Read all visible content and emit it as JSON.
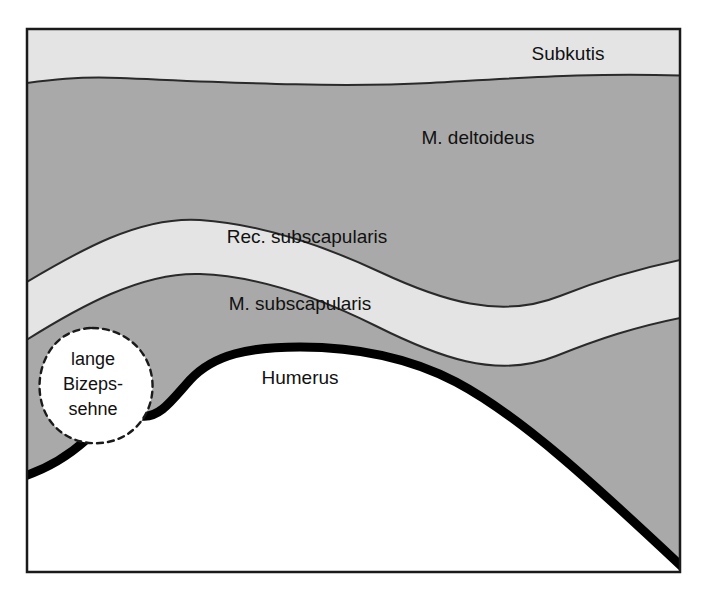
{
  "figure": {
    "frame": {
      "border_color": "#1a1a1a",
      "background_color": "#ffffff"
    },
    "colors": {
      "muscle_gray": "#a9a9a9",
      "fascia_light": "#e4e4e4",
      "bone_white": "#ffffff",
      "outline_dark": "#2a2a2a",
      "bone_outline": "#000000",
      "text": "#111111"
    }
  },
  "layers": [
    {
      "id": "subkutis",
      "label": "Subkutis",
      "label_x": 568,
      "label_y": 55,
      "fill": "#e4e4e4",
      "type": "subcutaneous-tissue"
    },
    {
      "id": "m-deltoideus",
      "label": "M. deltoideus",
      "label_x": 478,
      "label_y": 139,
      "fill": "#a9a9a9",
      "type": "muscle"
    },
    {
      "id": "rec-subscapularis",
      "label": "Rec. subscapularis",
      "label_x": 307,
      "label_y": 238,
      "fill": "#e4e4e4",
      "type": "recess"
    },
    {
      "id": "m-subscapularis",
      "label": "M. subscapularis",
      "label_x": 300,
      "label_y": 305,
      "fill": "#a9a9a9",
      "type": "muscle"
    },
    {
      "id": "humerus",
      "label": "Humerus",
      "label_x": 300,
      "label_y": 379,
      "fill": "#ffffff",
      "type": "bone"
    }
  ],
  "annotations": [
    {
      "id": "lange-bizepssehne",
      "lines": [
        "lange",
        "Bizeps-",
        "sehne"
      ],
      "label_x": 93,
      "label_y": 384,
      "line_height": 25,
      "fill": "#ffffff",
      "outline_style": "dashed",
      "type": "long-biceps-tendon"
    }
  ]
}
